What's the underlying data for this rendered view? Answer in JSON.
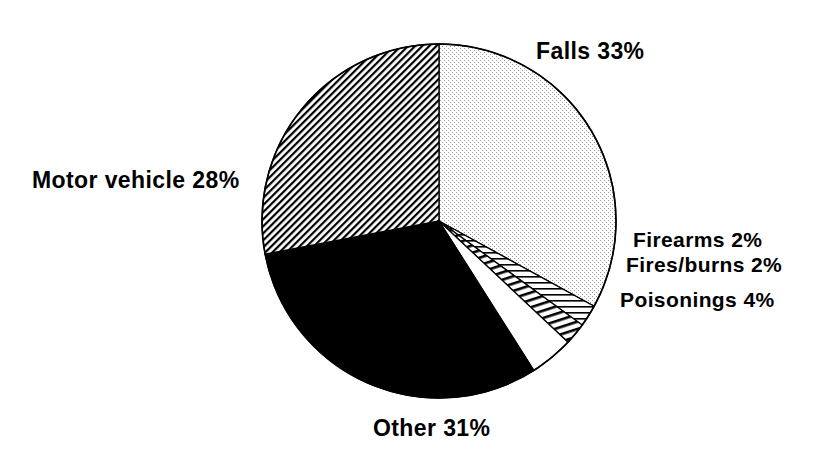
{
  "chart_data": {
    "type": "pie",
    "title": "",
    "subtitle": "",
    "xlabel": "",
    "ylabel": "",
    "legend_position": "none",
    "grid": false,
    "labels_outside": true,
    "total_percent": 100,
    "categories": [
      "Falls",
      "Firearms",
      "Fires/burns",
      "Poisonings",
      "Other",
      "Motor vehicle"
    ],
    "values": [
      33,
      2,
      2,
      4,
      31,
      28
    ],
    "slices": [
      {
        "name": "Falls",
        "label": "Falls 33%",
        "value": 33,
        "unit": "%",
        "fill": "stipple-dots",
        "fill_color": "#f2f2f2",
        "start_angle_deg": 0,
        "end_angle_deg": 118.8
      },
      {
        "name": "Firearms",
        "label": "Firearms 2%",
        "value": 2,
        "unit": "%",
        "fill": "horizontal-lines",
        "fill_color": "#ffffff",
        "start_angle_deg": 118.8,
        "end_angle_deg": 126.0
      },
      {
        "name": "Fires/burns",
        "label": "Fires/burns 2%",
        "value": 2,
        "unit": "%",
        "fill": "diagonal-hatch-steep",
        "fill_color": "#ffffff",
        "start_angle_deg": 126.0,
        "end_angle_deg": 133.2
      },
      {
        "name": "Poisonings",
        "label": "Poisonings 4%",
        "value": 4,
        "unit": "%",
        "fill": "blank-white",
        "fill_color": "#ffffff",
        "start_angle_deg": 133.2,
        "end_angle_deg": 147.6
      },
      {
        "name": "Other",
        "label": "Other 31%",
        "value": 31,
        "unit": "%",
        "fill": "solid-black",
        "fill_color": "#000000",
        "start_angle_deg": 147.6,
        "end_angle_deg": 259.2
      },
      {
        "name": "Motor vehicle",
        "label": "Motor vehicle 28%",
        "value": 28,
        "unit": "%",
        "fill": "diagonal-hatch-fine",
        "fill_color": "#ffffff",
        "start_angle_deg": 259.2,
        "end_angle_deg": 360.0
      }
    ],
    "geometry": {
      "center_x": 439,
      "center_y": 221,
      "radius": 177,
      "outline_color": "#000000"
    }
  },
  "labels": {
    "falls": "Falls 33%",
    "motor_vehicle": "Motor vehicle 28%",
    "firearms": "Firearms 2%",
    "fires_burns": "Fires/burns 2%",
    "poisonings": "Poisonings 4%",
    "other": "Other 31%"
  }
}
